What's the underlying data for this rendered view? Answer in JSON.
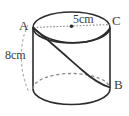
{
  "figure": {
    "type": "geometry-diagram",
    "labels": {
      "vertex_a": "A",
      "vertex_b": "B",
      "vertex_c": "C",
      "radius": "5cm",
      "height": "8cm"
    },
    "colors": {
      "outline": "#2b2b2b",
      "hidden_line": "#8a8a8a",
      "dotted_guide": "#8a8a8a",
      "text": "#3b3b3b",
      "background": "#ffffff"
    },
    "measurements": {
      "radius_value": 5,
      "radius_unit": "cm",
      "height_value": 8,
      "height_unit": "cm"
    },
    "elements": {
      "top_ellipse": "top-circular-face",
      "bottom_ellipse": "bottom-circular-face",
      "left_edge": "left-lateral-edge",
      "right_edge": "right-lateral-edge",
      "diameter_line": "dotted-diameter-A-to-C",
      "center_point": "top-face-center-dot",
      "helix_curve": "diagonal-surface-curve-A-to-B",
      "height_arc": "dashed-height-indicator-arc"
    }
  }
}
